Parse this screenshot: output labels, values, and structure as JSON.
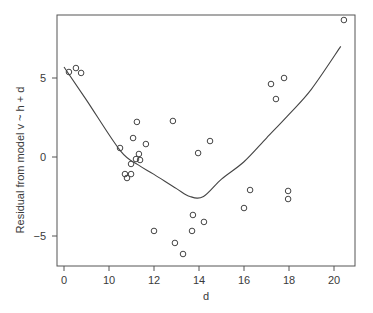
{
  "chart_data": {
    "type": "scatter",
    "title": "",
    "xlabel": "d",
    "ylabel": "Residual from model  v ~ h + d",
    "xlim": [
      7.7,
      21.2
    ],
    "ylim": [
      -6.9,
      9.0
    ],
    "x_ticks": [
      8,
      10,
      12,
      14,
      16,
      18,
      20
    ],
    "x_tick_labels": [
      "0",
      "10",
      "12",
      "14",
      "16",
      "18",
      "20"
    ],
    "y_ticks": [
      -5,
      0,
      5
    ],
    "y_tick_labels": [
      "-5",
      "0",
      "5"
    ],
    "grid": false,
    "legend": null,
    "series": [
      {
        "name": "residuals",
        "kind": "points",
        "marker": "open-circle",
        "points": [
          [
            8.22,
            5.38
          ],
          [
            8.53,
            5.63
          ],
          [
            8.76,
            5.32
          ],
          [
            10.49,
            0.57
          ],
          [
            11.07,
            1.2
          ],
          [
            11.24,
            2.22
          ],
          [
            11.64,
            0.82
          ],
          [
            12.84,
            2.28
          ],
          [
            14.49,
            1.01
          ],
          [
            13.96,
            0.25
          ],
          [
            11.33,
            0.19
          ],
          [
            11.2,
            -0.13
          ],
          [
            11.38,
            -0.19
          ],
          [
            10.98,
            -0.44
          ],
          [
            10.71,
            -1.08
          ],
          [
            10.8,
            -1.33
          ],
          [
            10.98,
            -1.08
          ],
          [
            12.0,
            -4.68
          ],
          [
            12.93,
            -5.44
          ],
          [
            13.29,
            -6.14
          ],
          [
            13.73,
            -3.67
          ],
          [
            13.69,
            -4.68
          ],
          [
            14.22,
            -4.11
          ],
          [
            16.0,
            -3.23
          ],
          [
            16.27,
            -2.09
          ],
          [
            17.2,
            4.62
          ],
          [
            17.78,
            5.0
          ],
          [
            17.42,
            3.67
          ],
          [
            17.96,
            -2.15
          ],
          [
            17.96,
            -2.66
          ],
          [
            20.44,
            8.67
          ]
        ]
      },
      {
        "name": "smooth",
        "kind": "line",
        "points": [
          [
            8.0,
            5.7
          ],
          [
            9.0,
            3.6
          ],
          [
            10.5,
            0.4
          ],
          [
            11.3,
            -0.5
          ],
          [
            12.0,
            -1.1
          ],
          [
            13.0,
            -2.0
          ],
          [
            13.6,
            -2.5
          ],
          [
            14.2,
            -2.5
          ],
          [
            15.0,
            -1.4
          ],
          [
            16.0,
            -0.3
          ],
          [
            17.0,
            1.2
          ],
          [
            18.0,
            2.7
          ],
          [
            19.0,
            4.3
          ],
          [
            20.3,
            7.0
          ]
        ]
      }
    ]
  }
}
